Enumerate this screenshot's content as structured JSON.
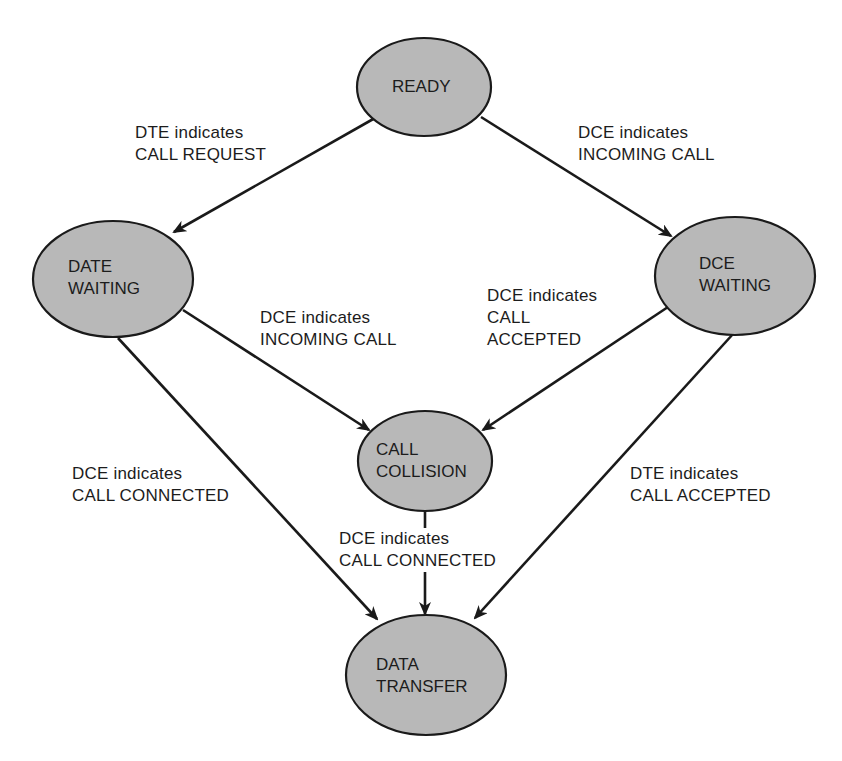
{
  "diagram": {
    "type": "state-transition",
    "colors": {
      "node_fill": "#b8b8b8",
      "stroke": "#1a1a1a",
      "background": "#ffffff"
    },
    "nodes": [
      {
        "id": "ready",
        "line1": "READY",
        "line2": ""
      },
      {
        "id": "date_waiting",
        "line1": "DATE",
        "line2": "WAITING"
      },
      {
        "id": "dce_waiting",
        "line1": "DCE",
        "line2": "WAITING"
      },
      {
        "id": "call_collision",
        "line1": "CALL",
        "line2": "COLLISION"
      },
      {
        "id": "data_transfer",
        "line1": "DATA",
        "line2": "TRANSFER"
      }
    ],
    "edges": [
      {
        "from": "READY",
        "to": "DATE WAITING",
        "line1": "DTE indicates",
        "line2": "CALL REQUEST",
        "line3": ""
      },
      {
        "from": "READY",
        "to": "DCE WAITING",
        "line1": "DCE indicates",
        "line2": "INCOMING CALL",
        "line3": ""
      },
      {
        "from": "DATE WAITING",
        "to": "CALL COLLISION",
        "line1": "DCE indicates",
        "line2": "INCOMING CALL",
        "line3": ""
      },
      {
        "from": "DCE WAITING",
        "to": "CALL COLLISION",
        "line1": "DCE indicates",
        "line2": "CALL",
        "line3": "ACCEPTED"
      },
      {
        "from": "DATE WAITING",
        "to": "DATA TRANSFER",
        "line1": "DCE indicates",
        "line2": "CALL CONNECTED",
        "line3": ""
      },
      {
        "from": "CALL COLLISION",
        "to": "DATA TRANSFER",
        "line1": "DCE indicates",
        "line2": "CALL CONNECTED",
        "line3": ""
      },
      {
        "from": "DCE WAITING",
        "to": "DATA TRANSFER",
        "line1": "DTE indicates",
        "line2": "CALL ACCEPTED",
        "line3": ""
      }
    ]
  }
}
